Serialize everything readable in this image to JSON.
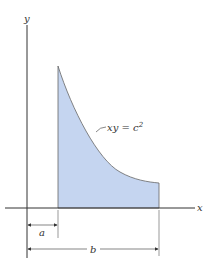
{
  "diagram": {
    "axes": {
      "x_label": "x",
      "y_label": "y"
    },
    "curve_label": {
      "lhs": "xy = c",
      "exponent": "2"
    },
    "dimensions": {
      "a_label": "a",
      "b_label": "b"
    },
    "colors": {
      "fill": "#c5d5f0",
      "stroke": "#555555",
      "axis": "#333333"
    }
  }
}
